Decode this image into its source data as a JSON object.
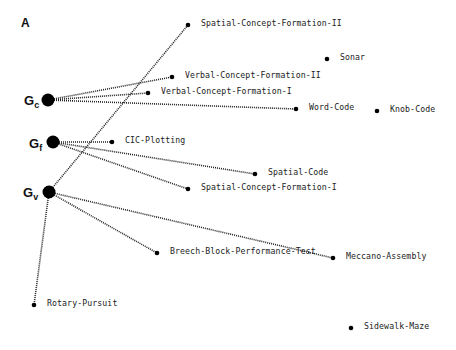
{
  "panel": {
    "label": "A"
  },
  "factors": [
    {
      "id": "gc",
      "main": "G",
      "sub": "c",
      "x": 48,
      "y": 100,
      "lx": 24,
      "ly": 94
    },
    {
      "id": "gf",
      "main": "G",
      "sub": "f",
      "x": 53,
      "y": 142,
      "lx": 29,
      "ly": 137
    },
    {
      "id": "gv",
      "main": "G",
      "sub": "v",
      "x": 49,
      "y": 192,
      "lx": 23,
      "ly": 186
    }
  ],
  "tests": [
    {
      "id": "scf2",
      "label": "Spatial-Concept-Formation-II",
      "x": 188,
      "y": 25
    },
    {
      "id": "sonar",
      "label": "Sonar",
      "x": 327,
      "y": 59
    },
    {
      "id": "vcf2",
      "label": "Verbal-Concept-Formation-II",
      "x": 172,
      "y": 77
    },
    {
      "id": "vcf1",
      "label": "Verbal-Concept-Formation-I",
      "x": 148,
      "y": 93
    },
    {
      "id": "wordcode",
      "label": "Word-Code",
      "x": 296,
      "y": 109
    },
    {
      "id": "knobcode",
      "label": "Knob-Code",
      "x": 377,
      "y": 111
    },
    {
      "id": "cic",
      "label": "CIC-Plotting",
      "x": 112,
      "y": 142
    },
    {
      "id": "spatialcode",
      "label": "Spatial-Code",
      "x": 255,
      "y": 174
    },
    {
      "id": "scf1",
      "label": "Spatial-Concept-Formation-I",
      "x": 188,
      "y": 189
    },
    {
      "id": "breech",
      "label": "Breech-Block-Performance-Test",
      "x": 157,
      "y": 253
    },
    {
      "id": "meccano",
      "label": "Meccano-Assembly",
      "x": 333,
      "y": 258
    },
    {
      "id": "rotary",
      "label": "Rotary-Pursuit",
      "x": 34,
      "y": 305
    },
    {
      "id": "sidewalk",
      "label": "Sidewalk-Maze",
      "x": 351,
      "y": 328
    }
  ],
  "edges": [
    {
      "from": "gc",
      "to": "vcf2"
    },
    {
      "from": "gc",
      "to": "vcf1"
    },
    {
      "from": "gc",
      "to": "wordcode"
    },
    {
      "from": "gf",
      "to": "cic"
    },
    {
      "from": "gf",
      "to": "spatialcode"
    },
    {
      "from": "gf",
      "to": "scf1"
    },
    {
      "from": "gv",
      "to": "scf2"
    },
    {
      "from": "gv",
      "to": "meccano"
    },
    {
      "from": "gv",
      "to": "breech"
    },
    {
      "from": "gv",
      "to": "rotary"
    }
  ]
}
